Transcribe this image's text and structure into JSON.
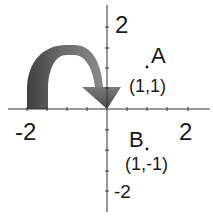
{
  "diagram": {
    "type": "coordinate-plane-reflection",
    "axes": {
      "x_tick_labels": {
        "neg": "-2",
        "pos": "2"
      },
      "y_tick_labels": {
        "pos": "2",
        "neg": "-2"
      },
      "range": [
        -2,
        2
      ],
      "ticks_per_unit": 2
    },
    "points": [
      {
        "name": "A",
        "coord_label": "(1,1)",
        "x": 1,
        "y": 1
      },
      {
        "name": "B",
        "coord_label": "(1,-1)",
        "x": 1,
        "y": -1
      }
    ],
    "arrow": {
      "description": "curved arrow showing flip/reflection",
      "color": "#6e6e6e"
    },
    "colors": {
      "axis": "#333333",
      "text": "#1a1a1a",
      "arrow_dark": "#4a4a4a",
      "arrow_light": "#9a9a9a"
    }
  }
}
